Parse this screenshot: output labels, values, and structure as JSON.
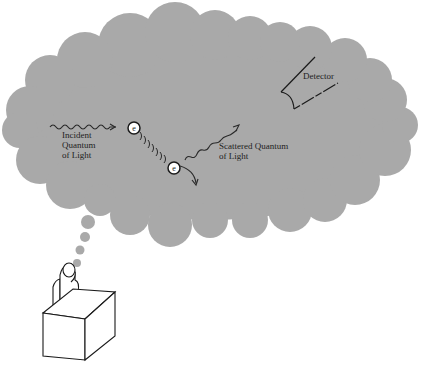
{
  "diagram": {
    "colors": {
      "cloud": "#a9a9a9",
      "ink": "#2a2a2a",
      "background": "#ffffff",
      "electron_fill": "#ffffff"
    },
    "labels": {
      "incident": [
        "Incident",
        "Quantum",
        "of Light"
      ],
      "scattered": [
        "Scattered Quantum",
        "of Light"
      ],
      "detector": "Detector"
    },
    "electrons": [
      {
        "symbol": "e",
        "role": "initial-position"
      },
      {
        "symbol": "e",
        "role": "recoiled-position"
      }
    ],
    "icons": {
      "thought-cloud": "cloud",
      "thinker": "person-at-desk",
      "detector": "detector-cone",
      "photon": "wavy-arrow"
    }
  }
}
